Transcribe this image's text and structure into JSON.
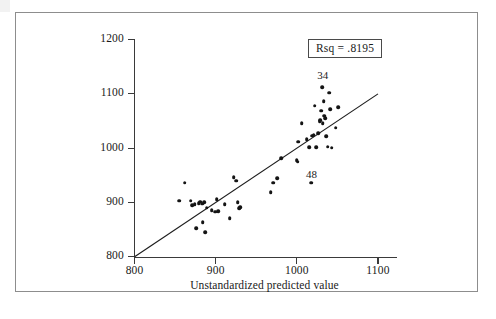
{
  "figure": {
    "frame_color": "#8d8d8d",
    "background": "#ffffff"
  },
  "annotation": {
    "rsq_label": "Rsq = .8195",
    "rsq_box_left_px": 292,
    "rsq_box_top_px": 26
  },
  "chart_data": {
    "type": "scatter",
    "title": "",
    "subtitle": "",
    "xlabel": "Unstandardized predicted value",
    "ylabel": "",
    "xlim": [
      800,
      1100
    ],
    "ylim": [
      800,
      1200
    ],
    "xticks": [
      800,
      900,
      1000,
      1100
    ],
    "yticks": [
      800,
      900,
      1000,
      1100,
      1200
    ],
    "xtick_labels": [
      "800",
      "900",
      "1000",
      "1100"
    ],
    "ytick_labels": [
      "800",
      "900",
      "1000",
      "1100",
      "1200"
    ],
    "grid": false,
    "legend": null,
    "marker": {
      "shape": "circle",
      "color": "#141414",
      "size_px": 3.6
    },
    "reference_line": {
      "kind": "identity",
      "x": [
        800,
        1100
      ],
      "y": [
        800,
        1100
      ],
      "color": "#1d1d1d",
      "width_px": 1.2
    },
    "annotations": [
      {
        "text": "Rsq = .8195",
        "kind": "boxed-text"
      },
      {
        "text": "34",
        "kind": "point-label",
        "x": 1032,
        "y": 1135
      },
      {
        "text": "48",
        "kind": "point-label",
        "x": 1018,
        "y": 952
      }
    ],
    "points": [
      {
        "x": 855,
        "y": 903
      },
      {
        "x": 862,
        "y": 936
      },
      {
        "x": 869,
        "y": 903
      },
      {
        "x": 871,
        "y": 895
      },
      {
        "x": 874,
        "y": 897
      },
      {
        "x": 876,
        "y": 852
      },
      {
        "x": 879,
        "y": 899
      },
      {
        "x": 881,
        "y": 901
      },
      {
        "x": 883,
        "y": 898
      },
      {
        "x": 884,
        "y": 864
      },
      {
        "x": 886,
        "y": 900
      },
      {
        "x": 887,
        "y": 845
      },
      {
        "x": 889,
        "y": 890
      },
      {
        "x": 895,
        "y": 886
      },
      {
        "x": 899,
        "y": 883
      },
      {
        "x": 901,
        "y": 906
      },
      {
        "x": 903,
        "y": 884
      },
      {
        "x": 911,
        "y": 897
      },
      {
        "x": 917,
        "y": 871
      },
      {
        "x": 922,
        "y": 947
      },
      {
        "x": 925,
        "y": 940
      },
      {
        "x": 927,
        "y": 900
      },
      {
        "x": 929,
        "y": 889
      },
      {
        "x": 930,
        "y": 891
      },
      {
        "x": 968,
        "y": 919
      },
      {
        "x": 971,
        "y": 936
      },
      {
        "x": 976,
        "y": 945
      },
      {
        "x": 981,
        "y": 981
      },
      {
        "x": 1000,
        "y": 978
      },
      {
        "x": 1001,
        "y": 975
      },
      {
        "x": 1002,
        "y": 1012
      },
      {
        "x": 1006,
        "y": 1046
      },
      {
        "x": 1012,
        "y": 1017
      },
      {
        "x": 1015,
        "y": 1002
      },
      {
        "x": 1018,
        "y": 936
      },
      {
        "x": 1019,
        "y": 1023
      },
      {
        "x": 1021,
        "y": 1025
      },
      {
        "x": 1022,
        "y": 1078
      },
      {
        "x": 1024,
        "y": 1002
      },
      {
        "x": 1026,
        "y": 1027
      },
      {
        "x": 1028,
        "y": 1050
      },
      {
        "x": 1029,
        "y": 1052
      },
      {
        "x": 1030,
        "y": 1069
      },
      {
        "x": 1031,
        "y": 1112
      },
      {
        "x": 1032,
        "y": 1046
      },
      {
        "x": 1033,
        "y": 1086
      },
      {
        "x": 1034,
        "y": 1060
      },
      {
        "x": 1035,
        "y": 1055
      },
      {
        "x": 1036,
        "y": 1022
      },
      {
        "x": 1038,
        "y": 1003
      },
      {
        "x": 1040,
        "y": 1102
      },
      {
        "x": 1041,
        "y": 1072
      },
      {
        "x": 1043,
        "y": 1001
      },
      {
        "x": 1048,
        "y": 1038
      },
      {
        "x": 1051,
        "y": 1075
      }
    ]
  }
}
